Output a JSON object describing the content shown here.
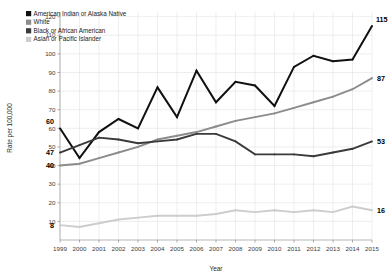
{
  "chart_data": {
    "type": "line",
    "title": "",
    "xlabel": "Year",
    "ylabel": "Rate per 100,000",
    "grid": true,
    "legend_position": "top-left",
    "xlim": [
      1999,
      2015
    ],
    "ylim": [
      0,
      120
    ],
    "x": [
      1999,
      2000,
      2001,
      2002,
      2003,
      2004,
      2005,
      2006,
      2007,
      2008,
      2009,
      2010,
      2011,
      2012,
      2013,
      2014,
      2015
    ],
    "xtick_labels": [
      "1999",
      "2000",
      "2001",
      "2002",
      "2003",
      "2004",
      "2005",
      "2006",
      "2007",
      "2008",
      "2009",
      "2010",
      "2011",
      "2012",
      "2013",
      "2014",
      "2015"
    ],
    "ytick_labels": [
      "10",
      "20",
      "30",
      "40",
      "50",
      "60",
      "70",
      "80",
      "90",
      "100",
      "110",
      "120"
    ],
    "yticks": [
      10,
      20,
      30,
      40,
      50,
      60,
      70,
      80,
      90,
      100,
      110,
      120
    ],
    "series": [
      {
        "name": "American Indian or Alaska Native",
        "color": "#111111",
        "values": [
          60,
          44,
          58,
          65,
          60,
          82,
          66,
          91,
          74,
          85,
          83,
          72,
          93,
          99,
          96,
          97,
          115
        ],
        "start_label": "60",
        "end_label": "115"
      },
      {
        "name": "White",
        "color": "#8c8c8c",
        "values": [
          40,
          41,
          44,
          47,
          50,
          54,
          56,
          58,
          61,
          64,
          66,
          68,
          71,
          74,
          77,
          81,
          87
        ],
        "start_label": "40",
        "end_label": "87"
      },
      {
        "name": "Black or African American",
        "color": "#3a3a3a",
        "values": [
          47,
          51,
          55,
          54,
          52,
          53,
          54,
          57,
          57,
          53,
          46,
          46,
          46,
          45,
          47,
          49,
          53
        ],
        "start_label": "47",
        "end_label": "53"
      },
      {
        "name": "Asian or Pacific Islander",
        "color": "#cdcdcd",
        "values": [
          8,
          7,
          9,
          11,
          12,
          13,
          13,
          13,
          14,
          16,
          15,
          16,
          15,
          16,
          15,
          18,
          16
        ],
        "start_label": "8",
        "end_label": "16"
      }
    ]
  },
  "legend": {
    "items": [
      {
        "label": "American Indian or Alaska Native",
        "swatch": "#111111"
      },
      {
        "label": "White",
        "swatch": "#8c8c8c"
      },
      {
        "label": "Black or African American",
        "swatch": "#3a3a3a"
      },
      {
        "label": "Asian or Pacific Islander",
        "swatch": "#cdcdcd"
      }
    ]
  },
  "axes": {
    "y_title": "Rate per 100,000",
    "x_title": "Year"
  }
}
